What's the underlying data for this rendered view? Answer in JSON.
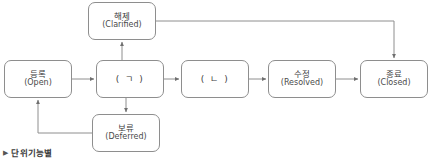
{
  "diagram": {
    "type": "state-flow-diagram",
    "title_caption": "단위기능별",
    "caption_marker": "▶",
    "line_color": "#8e8e8e",
    "node_border_color": "#8e8e8e",
    "node_fill_color": "#ffffff",
    "text_color": "#3c3c3c",
    "background_color": "#ffffff",
    "nodes": [
      {
        "id": "clarified",
        "ko": "해제",
        "en": "(Clarified)"
      },
      {
        "id": "open",
        "ko": "등록",
        "en": "(Open)"
      },
      {
        "id": "jamo1",
        "ko": "( ㄱ )",
        "en": ""
      },
      {
        "id": "jamo2",
        "ko": "( ㄴ )",
        "en": ""
      },
      {
        "id": "resolved",
        "ko": "수정",
        "en": "(Resolved)"
      },
      {
        "id": "closed",
        "ko": "종료",
        "en": "(Closed)"
      },
      {
        "id": "deferred",
        "ko": "보류",
        "en": "(Deferred)"
      }
    ],
    "edges": [
      {
        "from": "open",
        "to": "jamo1",
        "style": "straight-right"
      },
      {
        "from": "jamo1",
        "to": "jamo2",
        "style": "straight-right"
      },
      {
        "from": "jamo2",
        "to": "resolved",
        "style": "straight-right"
      },
      {
        "from": "resolved",
        "to": "closed",
        "style": "straight-right"
      },
      {
        "from": "jamo1",
        "to": "clarified",
        "style": "straight-up"
      },
      {
        "from": "jamo1",
        "to": "deferred",
        "style": "straight-down"
      },
      {
        "from": "clarified",
        "to": "closed",
        "style": "elbow-right-down"
      },
      {
        "from": "deferred",
        "to": "open",
        "style": "elbow-left-up"
      }
    ]
  }
}
